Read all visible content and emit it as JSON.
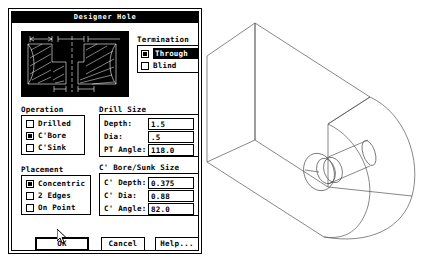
{
  "dialog": {
    "title": "Designer Hole"
  },
  "preview": {
    "name": "hole-cross-section-preview",
    "dimension_labels": [
      "C' Dia",
      "Dia",
      "Depth",
      "Dia"
    ]
  },
  "termination": {
    "label": "Termination",
    "options": [
      {
        "label": "Through",
        "selected": true,
        "highlighted": true
      },
      {
        "label": "Blind",
        "selected": false,
        "highlighted": false
      }
    ]
  },
  "operation": {
    "label": "Operation",
    "options": [
      {
        "label": "Drilled",
        "selected": false
      },
      {
        "label": "C'Bore",
        "selected": true
      },
      {
        "label": "C'Sink",
        "selected": false
      }
    ]
  },
  "placement": {
    "label": "Placement",
    "options": [
      {
        "label": "Concentric",
        "selected": true
      },
      {
        "label": "2 Edges",
        "selected": false
      },
      {
        "label": "On Point",
        "selected": false
      }
    ]
  },
  "drill_size": {
    "label": "Drill Size",
    "fields": [
      {
        "label": "Depth:",
        "value": "1.5"
      },
      {
        "label": "Dia:",
        "value": ".5"
      },
      {
        "label": "PT Angle:",
        "value": "118.0"
      }
    ]
  },
  "cbore_size": {
    "label": "C' Bore/Sunk Size",
    "fields": [
      {
        "label": "C' Depth:",
        "value": "0.375"
      },
      {
        "label": "C' Dia:",
        "value": "0.88"
      },
      {
        "label": "C' Angle:",
        "value": "82.0"
      }
    ]
  },
  "buttons": {
    "ok": "OK",
    "cancel": "Cancel",
    "help": "Help..."
  },
  "colors": {
    "window_bg": "#ffffff",
    "frame": "#000000",
    "titlebar_bg": "#000000",
    "titlebar_text": "#ffffff",
    "preview_bg": "#000000",
    "preview_line": "#ffffff",
    "model_line": "#555555"
  },
  "model": {
    "name": "cad-wireframe-block-with-counterbore"
  }
}
